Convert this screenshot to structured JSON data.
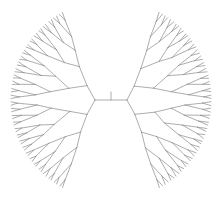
{
  "diagram": {
    "type": "dendrogram",
    "layout": "bilateral-fan",
    "background": "#ffffff",
    "line_color": "#8a8a8a",
    "root": {
      "x": 111,
      "y": 100,
      "tick_top": 92
    },
    "subtrees": [
      {
        "name": "left",
        "node": {
          "x": 95,
          "y": 100
        },
        "direction": -1,
        "depth": 5,
        "angle_start_deg": 118,
        "angle_end_deg": 242,
        "leaf_radius": 100
      },
      {
        "name": "right",
        "node": {
          "x": 127,
          "y": 100
        },
        "direction": 1,
        "depth": 5,
        "angle_start_deg": -62,
        "angle_end_deg": 62,
        "leaf_radius": 100
      }
    ],
    "leaf_count_per_side": 32
  }
}
